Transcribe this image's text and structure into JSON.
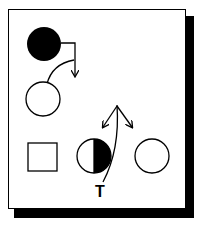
{
  "diagram": {
    "title": "",
    "nodes": [
      {
        "id": "filled-circle",
        "shape": "circle",
        "fill": "black"
      },
      {
        "id": "empty-circle-top",
        "shape": "circle",
        "fill": "white"
      },
      {
        "id": "square",
        "shape": "square",
        "fill": "white"
      },
      {
        "id": "half-circle",
        "shape": "circle",
        "fill": "half-black-right"
      },
      {
        "id": "empty-circle-right",
        "shape": "circle",
        "fill": "white"
      }
    ],
    "edges": [
      {
        "from": "filled-circle",
        "to": "arrow-down",
        "type": "elbow-arrow"
      },
      {
        "from": "empty-circle-top",
        "to": "curve",
        "type": "curve"
      },
      {
        "from": "T",
        "to": "fork",
        "type": "curved-line-split-two-arrows"
      }
    ],
    "labels": {
      "t_label": "T"
    },
    "colors": {
      "ink": "#000000",
      "paper": "#ffffff"
    }
  }
}
